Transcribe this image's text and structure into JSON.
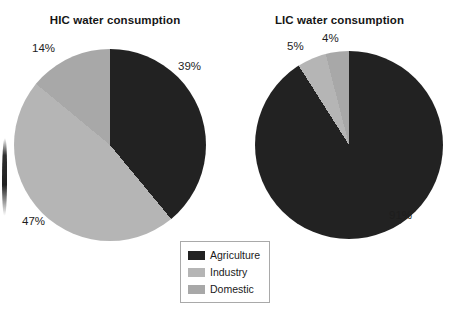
{
  "figure": {
    "background": "#ffffff",
    "artifact": "page-binding-shadow"
  },
  "colors": {
    "agriculture": "#222222",
    "industry": "#b5b5b5",
    "domestic": "#a8a8a8",
    "text": "#1a1a1a",
    "legend_border": "#a9a9a9"
  },
  "legend": {
    "items": [
      {
        "label": "Agriculture",
        "color": "#222222"
      },
      {
        "label": "Industry",
        "color": "#b5b5b5"
      },
      {
        "label": "Domestic",
        "color": "#a8a8a8"
      }
    ]
  },
  "charts": {
    "hic": {
      "title": "HIC water consumption",
      "labels": {
        "agriculture": "39%",
        "industry": "47%",
        "domestic": "14%"
      }
    },
    "lic": {
      "title": "LIC water consumption",
      "labels": {
        "agriculture": "91%",
        "industry": "5%",
        "domestic": "4%"
      }
    }
  },
  "chart_data": [
    {
      "type": "pie",
      "title": "HIC water consumption",
      "categories": [
        "Agriculture",
        "Industry",
        "Domestic"
      ],
      "values": [
        39,
        47,
        14
      ],
      "value_labels": [
        "39%",
        "47%",
        "14%"
      ],
      "unit": "percent",
      "colors": [
        "#222222",
        "#b5b5b5",
        "#a8a8a8"
      ],
      "start_angle_deg": 0,
      "direction": "clockwise",
      "legend": "shared, below between charts",
      "labels_position": "outside"
    },
    {
      "type": "pie",
      "title": "LIC water consumption",
      "categories": [
        "Agriculture",
        "Industry",
        "Domestic"
      ],
      "values": [
        91,
        5,
        4
      ],
      "value_labels": [
        "91%",
        "5%",
        "4%"
      ],
      "unit": "percent",
      "colors": [
        "#222222",
        "#b5b5b5",
        "#a8a8a8"
      ],
      "start_angle_deg": 0,
      "direction": "clockwise",
      "legend": "shared, below between charts",
      "labels_position": "outside"
    }
  ]
}
